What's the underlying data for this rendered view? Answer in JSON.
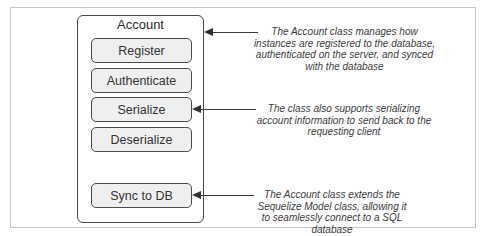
{
  "diagram": {
    "class_name": "Account",
    "methods": [
      {
        "label": "Register"
      },
      {
        "label": "Authenticate"
      },
      {
        "label": "Serialize"
      },
      {
        "label": "Deserialize"
      },
      {
        "label": "Sync to DB"
      }
    ],
    "annotations": [
      {
        "target": "Account",
        "text": "The Account class manages how instances are registered to the database, authenticated on the server, and synced with the database"
      },
      {
        "target": "Serialize",
        "text": "The class also supports serializing account information to send back to the requesting client"
      },
      {
        "target": "Sync to DB",
        "text": "The Account class extends the Sequelize Model class, allowing it to seamlessly connect to a SQL database"
      }
    ],
    "colors": {
      "border": "#4a4a4a",
      "method_fill": "#efefef",
      "arrow": "#3a3a3a",
      "frame": "#c8c8c8"
    }
  }
}
